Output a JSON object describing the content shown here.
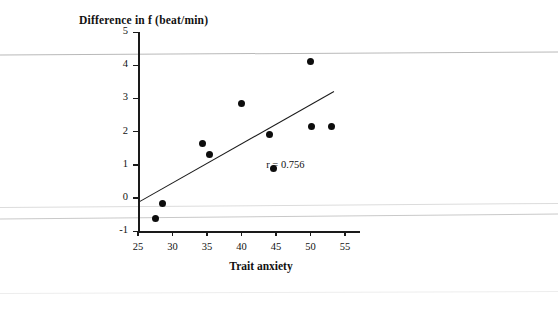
{
  "chart_data": {
    "type": "scatter",
    "title": "Difference in f (beat/min)",
    "xlabel": "Trait anxiety",
    "ylabel": "Difference in f (beat/min)",
    "xlim": [
      25,
      56
    ],
    "ylim": [
      -1,
      5
    ],
    "xticks": [
      25,
      30,
      35,
      40,
      45,
      50,
      55
    ],
    "yticks": [
      -1,
      0,
      1,
      2,
      3,
      4,
      5
    ],
    "xtick_labels": [
      "25",
      "30",
      "35",
      "40",
      "45",
      "50",
      "55"
    ],
    "ytick_labels": [
      "-1",
      "0",
      "1",
      "2",
      "3",
      "4",
      "5"
    ],
    "grid": false,
    "legend": "none",
    "annotations": [
      {
        "text": "r = 0.756",
        "x": 47.5,
        "y": 0.95
      }
    ],
    "series": [
      {
        "name": "Subjects",
        "marker": "filled-circle",
        "color": "#0d0d0d",
        "points": [
          {
            "x": 27.5,
            "y": -0.62
          },
          {
            "x": 28.6,
            "y": -0.17
          },
          {
            "x": 34.4,
            "y": 1.65
          },
          {
            "x": 35.4,
            "y": 1.32
          },
          {
            "x": 40.0,
            "y": 2.83
          },
          {
            "x": 44.0,
            "y": 1.9
          },
          {
            "x": 44.6,
            "y": 0.87
          },
          {
            "x": 50.0,
            "y": 4.1
          },
          {
            "x": 50.2,
            "y": 2.15
          },
          {
            "x": 53.0,
            "y": 2.15
          }
        ]
      }
    ],
    "fit_line": {
      "name": "regression-line",
      "color": "#1a1a1a",
      "x_start": 25.0,
      "y_start": -0.13,
      "x_end": 53.4,
      "y_end": 3.22,
      "correlation": "r = 0.756"
    },
    "artifact_lines": [
      {
        "name": "scan-line-top",
        "y_px": 53,
        "color": "#b9b9b9",
        "tilt_px": 3
      },
      {
        "name": "scan-line-mid",
        "y_px": 205,
        "color": "#dcdcdc",
        "tilt_px": 4
      },
      {
        "name": "scan-line-lower",
        "y_px": 216,
        "color": "#c9c9c9",
        "tilt_px": 5
      },
      {
        "name": "scan-line-bottom",
        "y_px": 292,
        "color": "#ededed",
        "tilt_px": 2
      }
    ]
  },
  "colors": {
    "axis": "#1a1a1a",
    "marker": "#0d0d0d",
    "background": "#ffffff"
  }
}
